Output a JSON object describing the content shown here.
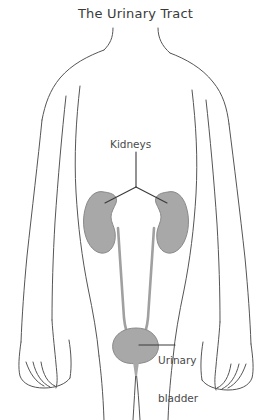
{
  "figure": {
    "title": "The Urinary Tract",
    "labels": {
      "kidneys": "Kidneys",
      "bladder_line1": "Urinary",
      "bladder_line2": "bladder"
    },
    "organs": [
      {
        "name": "left-kidney",
        "label": "Kidneys"
      },
      {
        "name": "right-kidney",
        "label": "Kidneys"
      },
      {
        "name": "left-ureter",
        "label": ""
      },
      {
        "name": "right-ureter",
        "label": ""
      },
      {
        "name": "urinary-bladder",
        "label": "Urinary bladder"
      },
      {
        "name": "urethra",
        "label": ""
      }
    ],
    "colors": {
      "organ_fill": "#a8a8a8",
      "organ_stroke": "#8a8a8a",
      "body_outline": "#555555",
      "leader_line": "#3a3a3a",
      "title_text": "#3a3a3a",
      "label_text": "#4a4a4a",
      "background": "#ffffff"
    }
  }
}
